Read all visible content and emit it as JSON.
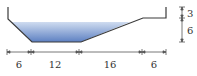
{
  "diagram": {
    "type": "channel-cross-section",
    "colors": {
      "outline": "#3a3a3a",
      "water_top": "#c9d9ef",
      "water_bottom": "#5a7fc0",
      "dimension": "#555555"
    },
    "horizontal_dimensions": [
      {
        "label": "6"
      },
      {
        "label": "12"
      },
      {
        "label": "16"
      },
      {
        "label": "6"
      }
    ],
    "vertical_dimensions": [
      {
        "label": "3"
      },
      {
        "label": "6"
      }
    ]
  }
}
